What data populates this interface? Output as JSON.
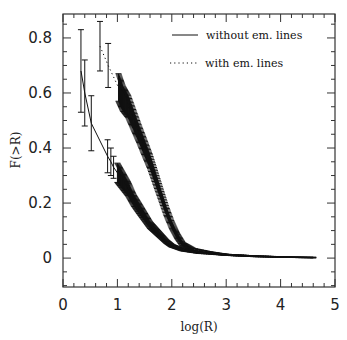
{
  "chart_data": {
    "type": "line",
    "title": "",
    "xlabel": "log(R)",
    "ylabel": "F(>R)",
    "xlim": [
      0,
      5
    ],
    "ylim": [
      -0.105,
      0.887
    ],
    "x_ticks": [
      0,
      1,
      2,
      3,
      4,
      5
    ],
    "x_tick_labels": [
      "0",
      "1",
      "2",
      "3",
      "4",
      "5"
    ],
    "y_ticks": [
      0,
      0.2,
      0.4,
      0.6,
      0.8
    ],
    "y_tick_labels": [
      "0",
      "0.2",
      "0.4",
      "0.6",
      "0.8"
    ],
    "x_minor_step": 0.2,
    "y_minor_step": 0.05,
    "grid": false,
    "legend_position": "upper right",
    "series": [
      {
        "name": "without em. lines",
        "style": "solid",
        "x": [
          0.33,
          0.4,
          0.52,
          0.82,
          0.88,
          0.93,
          1.0,
          1.1,
          1.2,
          1.3,
          1.4,
          1.5,
          1.6,
          1.7,
          1.8,
          1.9,
          2.0,
          2.2,
          2.5,
          3.0,
          3.5,
          4.0,
          4.6
        ],
        "y": [
          0.68,
          0.6,
          0.49,
          0.37,
          0.35,
          0.33,
          0.31,
          0.28,
          0.25,
          0.21,
          0.18,
          0.15,
          0.12,
          0.1,
          0.08,
          0.06,
          0.045,
          0.03,
          0.02,
          0.012,
          0.007,
          0.004,
          0.002
        ],
        "err": [
          0.15,
          0.12,
          0.1,
          0.06,
          0.05,
          0.04,
          0.035,
          0.03,
          0.025,
          0.02,
          0.018,
          0.015,
          0.012,
          0.01,
          0.008,
          0.006,
          0.005,
          0.004,
          0.003,
          0.002,
          0.0015,
          0.001,
          0.001
        ]
      },
      {
        "name": "with em. lines",
        "style": "dotted",
        "x": [
          0.68,
          0.83,
          1.02,
          1.1,
          1.2,
          1.3,
          1.4,
          1.5,
          1.6,
          1.7,
          1.8,
          1.9,
          2.0,
          2.1,
          2.2,
          2.4,
          2.7,
          3.0,
          3.5,
          4.0,
          4.6
        ],
        "y": [
          0.77,
          0.7,
          0.62,
          0.58,
          0.55,
          0.5,
          0.45,
          0.4,
          0.35,
          0.29,
          0.23,
          0.17,
          0.12,
          0.08,
          0.05,
          0.03,
          0.02,
          0.012,
          0.007,
          0.004,
          0.002
        ],
        "err": [
          0.09,
          0.08,
          0.05,
          0.045,
          0.04,
          0.035,
          0.03,
          0.028,
          0.025,
          0.022,
          0.018,
          0.015,
          0.012,
          0.009,
          0.007,
          0.005,
          0.003,
          0.002,
          0.0015,
          0.001,
          0.001
        ]
      }
    ]
  },
  "legend": {
    "items": [
      {
        "label": "without em. lines",
        "style": "solid"
      },
      {
        "label": "with em. lines",
        "style": "dotted"
      }
    ]
  },
  "colors": {
    "line": "#111111",
    "axis": "#333333",
    "background": "#ffffff"
  }
}
